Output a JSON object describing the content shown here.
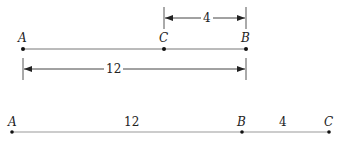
{
  "diagram": {
    "top": {
      "points": [
        {
          "label": "A",
          "x": 23
        },
        {
          "label": "C",
          "x": 164
        },
        {
          "label": "B",
          "x": 246
        }
      ],
      "dimensions": [
        {
          "label": "4",
          "from": "C",
          "to": "B"
        },
        {
          "label": "12",
          "from": "A",
          "to": "B"
        }
      ]
    },
    "bottom": {
      "points": [
        {
          "label": "A",
          "x": 12
        },
        {
          "label": "B",
          "x": 242
        },
        {
          "label": "C",
          "x": 329
        }
      ],
      "segments": [
        {
          "label": "12",
          "from": "A",
          "to": "B"
        },
        {
          "label": "4",
          "from": "B",
          "to": "C"
        }
      ]
    },
    "colors": {
      "line": "#555555",
      "ink": "#222222"
    }
  }
}
